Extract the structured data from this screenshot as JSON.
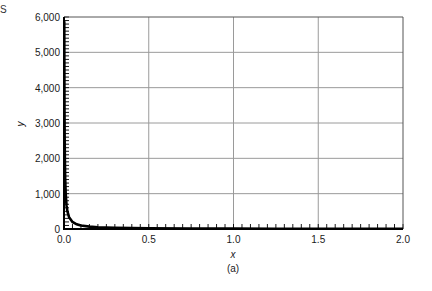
{
  "corner_mark": "S",
  "chart_data": {
    "type": "line",
    "title": "",
    "caption": "(a)",
    "xlabel": "x",
    "ylabel": "y",
    "xlim": [
      0.0,
      2.0
    ],
    "ylim": [
      0,
      6000
    ],
    "x_ticks": [
      0.0,
      0.5,
      1.0,
      1.5,
      2.0
    ],
    "x_tick_labels": [
      "0.0",
      "0.5",
      "1.0",
      "1.5",
      "2.0"
    ],
    "y_ticks": [
      0,
      1000,
      2000,
      3000,
      4000,
      5000,
      6000
    ],
    "y_tick_labels": [
      "0",
      "1,000",
      "2,000",
      "3,000",
      "4,000",
      "5,000",
      "6,000"
    ],
    "grid": true,
    "x_minor_step": 0.05,
    "y_minor_step": 100,
    "series": [
      {
        "name": "y = 10/x",
        "color": "#000000",
        "x": [
          0.0017,
          0.002,
          0.0025,
          0.003,
          0.004,
          0.005,
          0.007,
          0.01,
          0.015,
          0.02,
          0.03,
          0.05,
          0.075,
          0.1,
          0.15,
          0.2,
          0.3,
          0.5,
          0.75,
          1.0,
          1.25,
          1.5,
          1.75,
          2.0
        ],
        "values": [
          5882,
          5000,
          4000,
          3333,
          2500,
          2000,
          1429,
          1000,
          667,
          500,
          333,
          200,
          133,
          100,
          67,
          50,
          33,
          20,
          13,
          10,
          8,
          7,
          6,
          5
        ]
      }
    ]
  },
  "colors": {
    "axis": "#000000",
    "grid": "#9a9a9a",
    "curve": "#000000"
  }
}
